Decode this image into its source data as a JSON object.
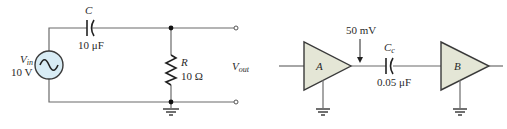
{
  "left_circuit": {
    "source": {
      "symbol": "V",
      "subscript": "in",
      "value": "10 V",
      "icon": "ac-source-icon"
    },
    "capacitor": {
      "name": "C",
      "value": "10 μF",
      "icon": "capacitor-icon"
    },
    "resistor": {
      "name": "R",
      "value": "10 Ω",
      "icon": "resistor-icon"
    },
    "output": {
      "symbol": "V",
      "subscript": "out"
    },
    "colors": {
      "wire": "#6b6b6b",
      "source_fill": "#d8ecf5",
      "source_stroke": "#3a3a3a"
    }
  },
  "right_circuit": {
    "amplifier_a": {
      "label": "A",
      "icon": "amplifier-icon"
    },
    "amplifier_b": {
      "label": "B",
      "icon": "amplifier-icon"
    },
    "signal_annotation": "50 mV",
    "coupling_capacitor": {
      "name": "C",
      "subscript": "c",
      "value": "0.05 μF",
      "icon": "capacitor-icon"
    },
    "colors": {
      "amp_fill": "#e4e6d6",
      "amp_stroke": "#3a3a3a"
    }
  }
}
